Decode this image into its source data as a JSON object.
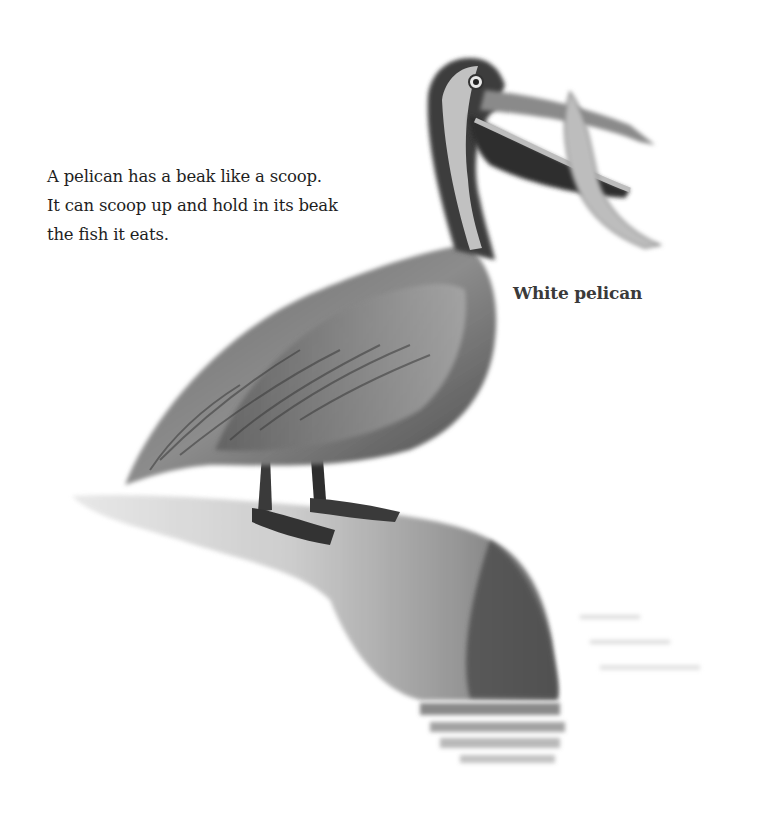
{
  "page": {
    "body_text": {
      "lines": [
        "A pelican has a beak like a scoop.",
        "It can scoop up and hold in its beak",
        "the fish it eats."
      ]
    },
    "caption": "White pelican",
    "illustration": {
      "subject": "pelican-standing-on-rock-holding-fish",
      "style": "grayscale watercolor"
    }
  }
}
